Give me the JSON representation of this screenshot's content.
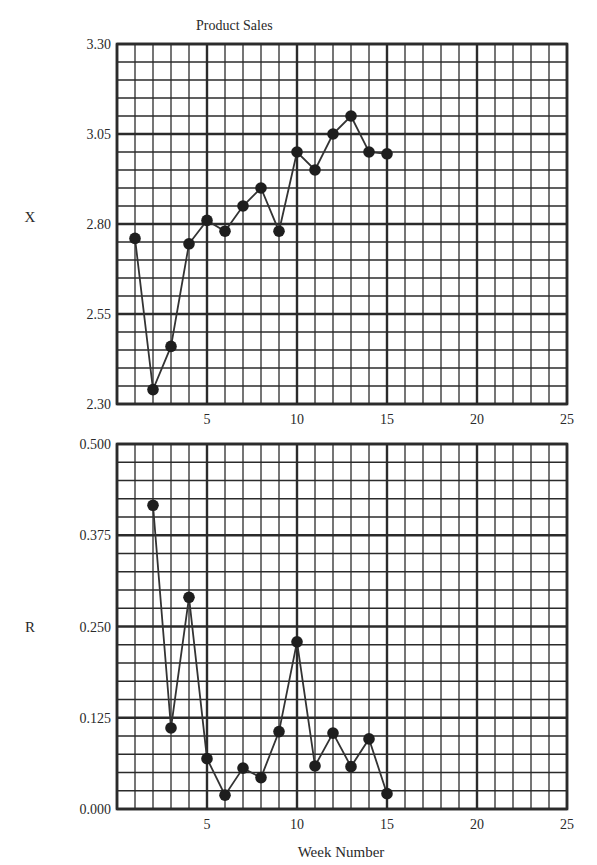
{
  "figure": {
    "title": "Product Sales",
    "shared_xlabel": "Week Number"
  },
  "chart_data": [
    {
      "type": "line",
      "title": "Product Sales",
      "ylabel": "X",
      "xlabel": "",
      "x": [
        1,
        2,
        3,
        4,
        5,
        6,
        7,
        8,
        9,
        10,
        11,
        12,
        13,
        14,
        15
      ],
      "series": [
        {
          "name": "X",
          "values": [
            2.76,
            2.34,
            2.46,
            2.745,
            2.81,
            2.78,
            2.85,
            2.9,
            2.78,
            3.0,
            2.95,
            3.05,
            3.1,
            3.0,
            2.995
          ]
        }
      ],
      "xlim": [
        0,
        25
      ],
      "ylim": [
        2.3,
        3.3
      ],
      "xticks": [
        5,
        10,
        15,
        20,
        25
      ],
      "yticks": [
        "2.30",
        "2.55",
        "2.80",
        "3.05",
        "3.30"
      ],
      "grid": true,
      "minor_x_step": 1,
      "minor_y_per_major": 5,
      "markers": "filled-circle",
      "legend": null
    },
    {
      "type": "line",
      "title": "",
      "ylabel": "R",
      "xlabel": "Week Number",
      "x": [
        2,
        3,
        4,
        5,
        6,
        7,
        8,
        9,
        10,
        11,
        12,
        13,
        14,
        15
      ],
      "series": [
        {
          "name": "R",
          "values": [
            0.416,
            0.111,
            0.29,
            0.069,
            0.019,
            0.056,
            0.043,
            0.106,
            0.229,
            0.059,
            0.104,
            0.058,
            0.096,
            0.021
          ]
        }
      ],
      "xlim": [
        0,
        25
      ],
      "ylim": [
        0.0,
        0.5
      ],
      "xticks": [
        5,
        10,
        15,
        20,
        25
      ],
      "yticks": [
        "0.000",
        "0.125",
        "0.250",
        "0.375",
        "0.500"
      ],
      "grid": true,
      "minor_x_step": 1,
      "minor_y_per_major": 5,
      "markers": "filled-circle",
      "legend": null
    }
  ],
  "style": {
    "grid_color": "#2b2b2b",
    "line_color": "#333333",
    "marker_color": "#1e1e1e",
    "background": "#ffffff"
  },
  "layout": {
    "plots": [
      {
        "left": 117,
        "right": 567,
        "top": 44,
        "bottom": 404,
        "ylabel_x": 30,
        "ylabel_y": 222
      },
      {
        "left": 117,
        "right": 567,
        "top": 444,
        "bottom": 809,
        "ylabel_x": 30,
        "ylabel_y": 632
      }
    ],
    "title_x": 196,
    "title_y": 30,
    "xlabel_x": 341,
    "xlabel_y": 857
  }
}
